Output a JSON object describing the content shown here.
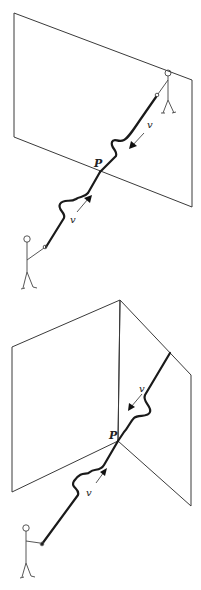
{
  "figure": {
    "panels": [
      {
        "id": "flat-boundary",
        "description": "Wave pulse on a rope passing through a flat plane boundary",
        "point_label": "P",
        "incoming_velocity_label": "v",
        "reflected_velocity_label": "v"
      },
      {
        "id": "angled-boundary",
        "description": "Wave pulse on a rope passing through the corner of two angled planes",
        "point_label": "P",
        "incoming_velocity_label": "v",
        "reflected_velocity_label": "v"
      }
    ]
  }
}
